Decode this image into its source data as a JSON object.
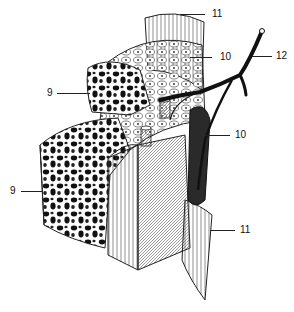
{
  "figure": {
    "background_color": "#ffffff",
    "ink_color": "#111111"
  },
  "labels": [
    {
      "id": "label-11-top",
      "text": "11",
      "x": 212,
      "y": 9,
      "leader_x1": 180,
      "leader_x2": 205,
      "leader_y": 14
    },
    {
      "id": "label-12",
      "text": "12",
      "x": 276,
      "y": 51,
      "leader_x1": 252,
      "leader_x2": 272,
      "leader_y": 56
    },
    {
      "id": "label-10-top",
      "text": "10",
      "x": 220,
      "y": 52,
      "leader_x1": 190,
      "leader_x2": 212,
      "leader_y": 57
    },
    {
      "id": "label-9-top",
      "text": "9",
      "x": 47,
      "y": 88,
      "leader_x1": 57,
      "leader_x2": 90,
      "leader_y": 93
    },
    {
      "id": "label-10-mid",
      "text": "10",
      "x": 235,
      "y": 130,
      "leader_x1": 205,
      "leader_x2": 230,
      "leader_y": 135
    },
    {
      "id": "label-9-bottom",
      "text": "9",
      "x": 10,
      "y": 186,
      "leader_x1": 21,
      "leader_x2": 42,
      "leader_y": 191
    },
    {
      "id": "label-11-bottom",
      "text": "11",
      "x": 240,
      "y": 225,
      "leader_x1": 210,
      "leader_x2": 235,
      "leader_y": 230
    }
  ]
}
